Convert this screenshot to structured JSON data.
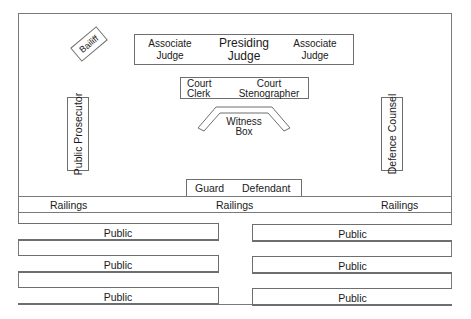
{
  "diagram": {
    "type": "courtroom-layout",
    "bailiff": {
      "label": "Bailiff"
    },
    "judges_bench": {
      "left": {
        "line1": "Associate",
        "line2": "Judge"
      },
      "center": {
        "line1": "Presiding",
        "line2": "Judge"
      },
      "right": {
        "line1": "Associate",
        "line2": "Judge"
      }
    },
    "clerk_desk": {
      "left": {
        "line1": "Court",
        "line2": "Clerk"
      },
      "right": {
        "line1": "Court",
        "line2": "Stenographer"
      }
    },
    "witness_box": {
      "line1": "Witness",
      "line2": "Box"
    },
    "public_prosecutor": {
      "label": "Public Prosecutor"
    },
    "defence_counsel": {
      "label": "Defence Counsel"
    },
    "dock": {
      "guard": "Guard",
      "defendant": "Defendant"
    },
    "railings": {
      "left": "Railings",
      "center": "Railings",
      "right": "Railings"
    },
    "public_seating": {
      "left": [
        "Public",
        "Public",
        "Public"
      ],
      "right": [
        "Public",
        "Public",
        "Public"
      ]
    },
    "colors": {
      "line": "#6e6e6e",
      "text": "#1a1a1a",
      "background": "#ffffff"
    }
  }
}
